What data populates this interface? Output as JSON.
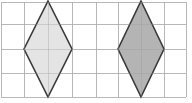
{
  "diagram": {
    "type": "grid-shapes",
    "grid": {
      "vertical_lines_x": [
        1,
        24,
        48,
        72,
        96,
        118,
        141,
        164,
        186
      ],
      "horizontal_lines_y": [
        2,
        24,
        49,
        73,
        97
      ],
      "color": "#c8c8c8"
    },
    "shapes": [
      {
        "name": "rhombus-left",
        "points": "48,1 72,49 48,97 24,49",
        "fill": "#e4e4e4",
        "stroke": "#3a3a3a"
      },
      {
        "name": "rhombus-right",
        "points": "141,1 164,49 141,97 118,49",
        "fill": "#b4b4b4",
        "stroke": "#3a3a3a"
      }
    ]
  }
}
